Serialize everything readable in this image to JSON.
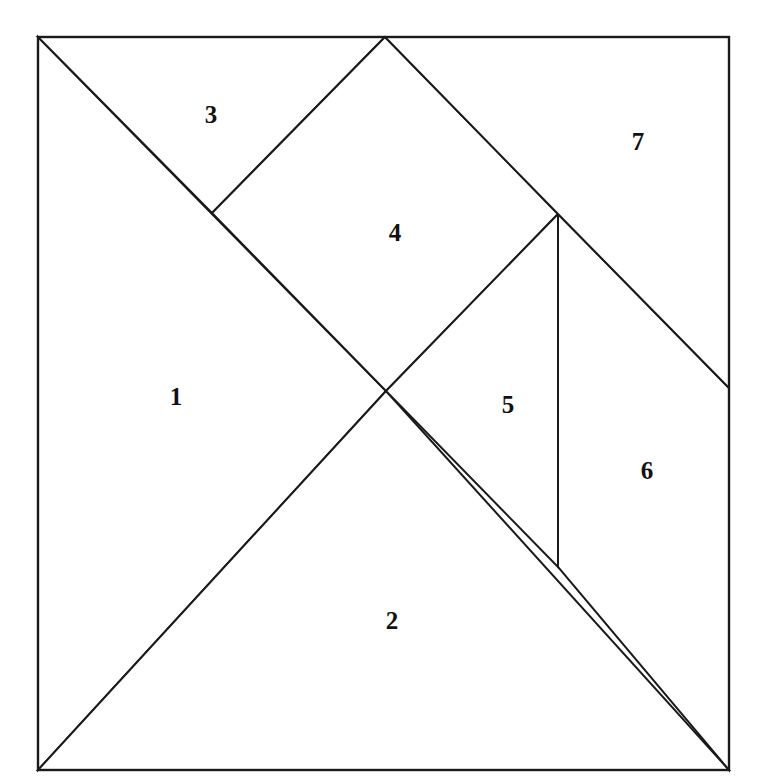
{
  "diagram": {
    "type": "tangram",
    "line_color": "#1a1a1a",
    "fill_color": "#ffffff",
    "label_color": "#111111",
    "outer_square": {
      "x": 38,
      "y": 37,
      "width": 691,
      "height": 733
    },
    "pieces": [
      {
        "id": 1,
        "label": "1",
        "shape": "triangle",
        "points": "38,37 386,391 38,770",
        "label_pos": [
          176,
          396
        ]
      },
      {
        "id": 2,
        "label": "2",
        "shape": "triangle",
        "points": "38,770 386,391 729,770",
        "label_pos": [
          392,
          620
        ]
      },
      {
        "id": 3,
        "label": "3",
        "shape": "triangle",
        "points": "38,37 385,37 212,213",
        "label_pos": [
          211,
          114
        ]
      },
      {
        "id": 4,
        "label": "4",
        "shape": "square",
        "points": "212,213 385,37 558,214 386,391",
        "label_pos": [
          395,
          232
        ]
      },
      {
        "id": 5,
        "label": "5",
        "shape": "triangle",
        "points": "386,391 558,214 558,567",
        "label_pos": [
          508,
          404
        ]
      },
      {
        "id": 6,
        "label": "6",
        "shape": "parallelogram",
        "points": "558,214 729,388 729,770 558,567",
        "label_pos": [
          647,
          470
        ]
      },
      {
        "id": 7,
        "label": "7",
        "shape": "trapezoid",
        "points": "385,37 729,37 729,388 558,214",
        "label_pos": [
          638,
          141
        ]
      }
    ]
  }
}
